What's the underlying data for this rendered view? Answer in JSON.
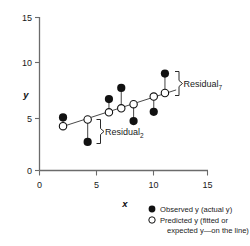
{
  "chart_data": {
    "type": "scatter",
    "title": "",
    "xlabel": "x",
    "ylabel": "y",
    "xlim": [
      0,
      15
    ],
    "ylim": [
      0,
      15
    ],
    "xticks": [
      0,
      5,
      10,
      15
    ],
    "yticks": [
      0,
      5,
      10,
      15
    ],
    "xtick_labels": [
      "0",
      "5",
      "10",
      "15"
    ],
    "ytick_labels": [
      "0",
      "5",
      "10",
      "15"
    ],
    "grid": false,
    "legend_position": "bottom-right",
    "series": [
      {
        "name": "Observed y (actual y)",
        "marker": "filled-circle",
        "x": [
          2.1,
          4.3,
          6.2,
          7.3,
          8.4,
          10.2,
          11.2
        ],
        "values": [
          5.2,
          2.8,
          7.0,
          8.1,
          4.85,
          5.75,
          9.5
        ]
      },
      {
        "name": "Predicted y (fitted or expected y—on the line)",
        "marker": "open-circle",
        "x": [
          2.1,
          4.3,
          6.2,
          7.3,
          8.4,
          10.2,
          11.2
        ],
        "values": [
          4.35,
          5.0,
          5.7,
          6.1,
          6.5,
          7.25,
          7.6
        ]
      }
    ],
    "fit_line": {
      "x": [
        1.9,
        12.2
      ],
      "y": [
        4.25,
        7.9
      ]
    },
    "annotations": [
      {
        "label": "Residual",
        "subscript": "2",
        "point_index": 1
      },
      {
        "label": "Residual",
        "subscript": "7",
        "point_index": 6
      }
    ]
  },
  "legend": {
    "items": [
      {
        "marker": "filled-circle",
        "label": "Observed y (actual y)"
      },
      {
        "marker": "open-circle",
        "label": "Predicted y (fitted or"
      },
      {
        "marker": "none",
        "label": "expected y—on the line)"
      }
    ]
  },
  "axes": {
    "x_title": "x",
    "y_title": "y"
  }
}
